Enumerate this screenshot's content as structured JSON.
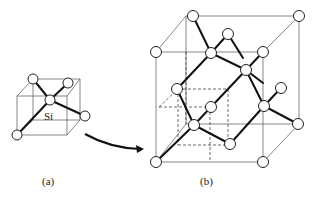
{
  "figure": {
    "panel_a": {
      "label": "(a)",
      "atom_label": "Si",
      "title": "tetrahedral unit"
    },
    "panel_b": {
      "label": "(b)",
      "title": "diamond cubic unit cell"
    },
    "arrow": {
      "from": "panel_a",
      "to": "panel_b"
    },
    "colors": {
      "line": "#111111",
      "atom_fill": "#ffffff",
      "background": "#ffffff"
    }
  }
}
